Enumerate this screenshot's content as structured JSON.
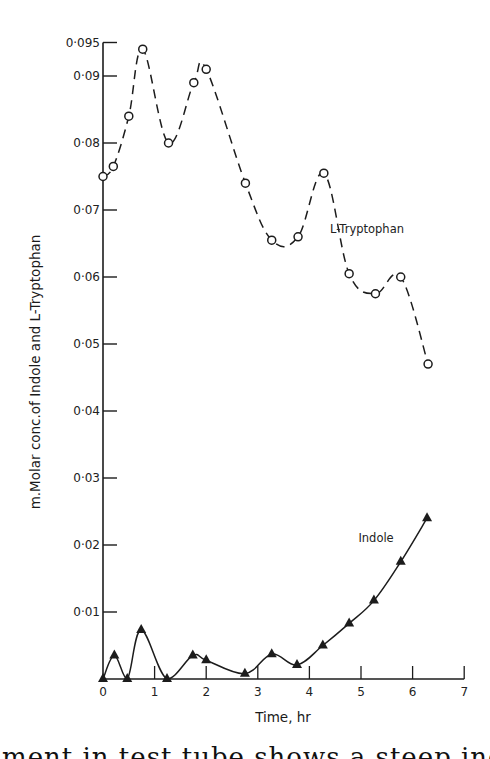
{
  "chart_data": {
    "type": "line",
    "title": "",
    "xlabel": "Time, hr",
    "ylabel": "m.Molar conc.of Indole and L-Tryptophan",
    "xlim": [
      0,
      7
    ],
    "ylim": [
      0,
      0.095
    ],
    "x_ticks": [
      0,
      1,
      2,
      3,
      4,
      5,
      6,
      7
    ],
    "x_tick_labels": [
      "0",
      "1",
      "2",
      "3",
      "4",
      "5",
      "6",
      "7"
    ],
    "y_ticks": [
      0.01,
      0.02,
      0.03,
      0.04,
      0.05,
      0.06,
      0.07,
      0.08,
      0.09,
      0.095
    ],
    "y_tick_labels": [
      "0·01",
      "0·02",
      "0·03",
      "0·04",
      "0·05",
      "0·06",
      "0·07",
      "0·08",
      "0·09",
      "0·095"
    ],
    "grid": false,
    "legend": "inline labels",
    "series": [
      {
        "name": "L-Tryptophan",
        "marker": "open-circle",
        "line_style": "dashed",
        "label_position": [
          4.4,
          0.0665
        ],
        "x": [
          0.0,
          0.2,
          0.5,
          0.77,
          1.27,
          1.76,
          2.0,
          2.76,
          3.27,
          3.78,
          4.28,
          4.77,
          5.28,
          5.77,
          6.3
        ],
        "values": [
          0.075,
          0.0765,
          0.084,
          0.094,
          0.08,
          0.089,
          0.091,
          0.074,
          0.0655,
          0.066,
          0.0755,
          0.0605,
          0.0575,
          0.06,
          0.047
        ]
      },
      {
        "name": "Indole",
        "marker": "filled-triangle",
        "line_style": "solid",
        "label_position": [
          4.95,
          0.0205
        ],
        "x": [
          0.0,
          0.22,
          0.47,
          0.74,
          1.24,
          1.74,
          2.0,
          2.75,
          3.27,
          3.76,
          4.26,
          4.77,
          5.25,
          5.77,
          6.28
        ],
        "values": [
          0.0,
          0.0035,
          0.0,
          0.0073,
          0.0,
          0.0035,
          0.0028,
          0.0008,
          0.0037,
          0.0021,
          0.005,
          0.0083,
          0.0117,
          0.0175,
          0.024
        ]
      }
    ]
  },
  "caption_fragment": "...ment in test tube shows a steep incline..."
}
